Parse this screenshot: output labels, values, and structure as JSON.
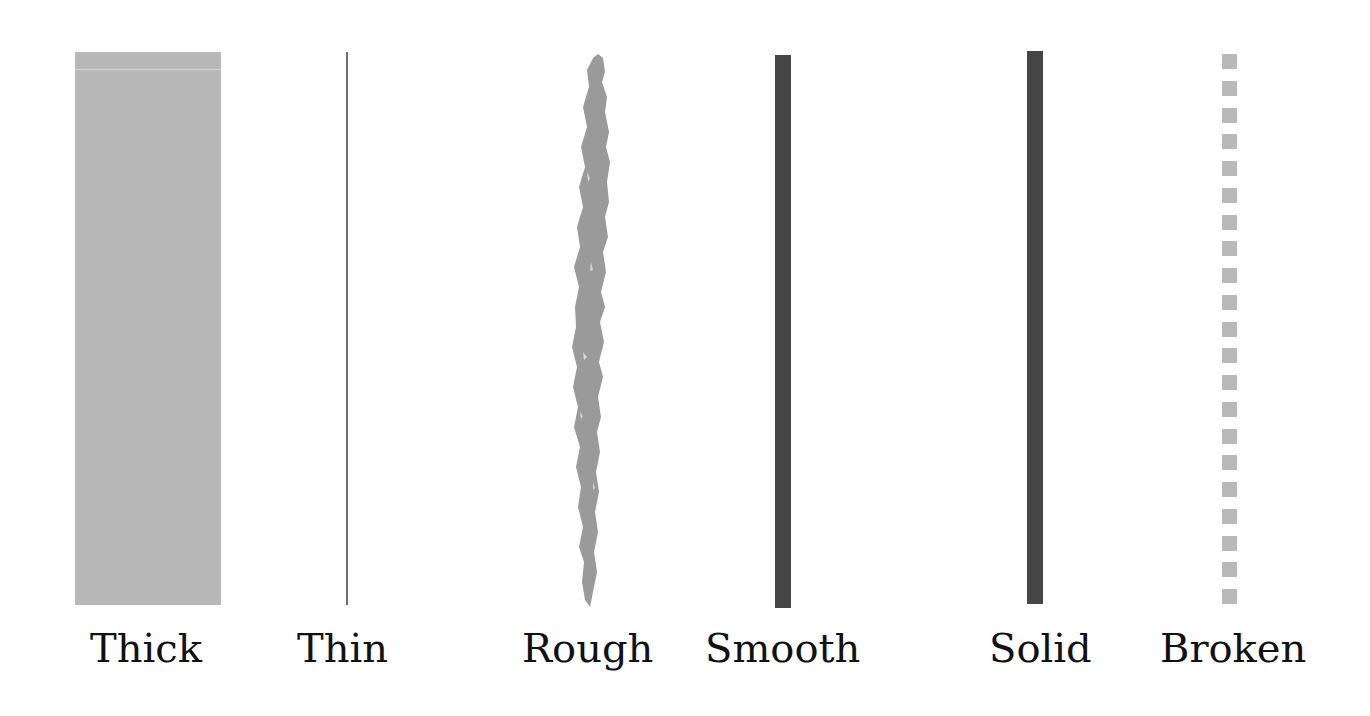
{
  "strokes": [
    {
      "id": "thick",
      "label": "Thick",
      "color": "#b8b8b8"
    },
    {
      "id": "thin",
      "label": "Thin",
      "color": "#6f6f6f"
    },
    {
      "id": "rough",
      "label": "Rough",
      "color": "#9a9a9a"
    },
    {
      "id": "smooth",
      "label": "Smooth",
      "color": "#454545"
    },
    {
      "id": "solid",
      "label": "Solid",
      "color": "#454545"
    },
    {
      "id": "broken",
      "label": "Broken",
      "color": "#b9b9b9",
      "dash_count": 21
    }
  ]
}
